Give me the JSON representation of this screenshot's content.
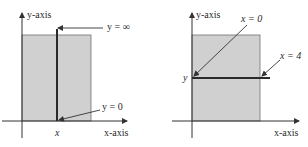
{
  "colors": {
    "shade": "#d0d0d0",
    "shade_border": "#707070",
    "axis": "#333333",
    "thick_line": "#2a2a2a",
    "text": "#2a2a2a"
  },
  "panels": [
    {
      "id": "left",
      "y_axis_label": "y-axis",
      "x_axis_label": "x-axis",
      "x_tick_label": "x",
      "annotations": [
        {
          "label": "y = ∞",
          "points_to": "top of vertical line"
        },
        {
          "label": "y = 0",
          "points_to": "bottom of vertical line"
        }
      ],
      "description": "Vertical line at fixed x spanning shaded region from y = 0 to y = ∞"
    },
    {
      "id": "right",
      "y_axis_label": "y-axis",
      "x_axis_label": "x-axis",
      "y_tick_label": "y",
      "annotations": [
        {
          "label": "x = 0",
          "points_to": "left end of horizontal line"
        },
        {
          "label": "x = 4",
          "points_to": "right end of horizontal line"
        }
      ],
      "description": "Horizontal line at fixed y spanning shaded region from x = 0 to x = 4"
    }
  ]
}
